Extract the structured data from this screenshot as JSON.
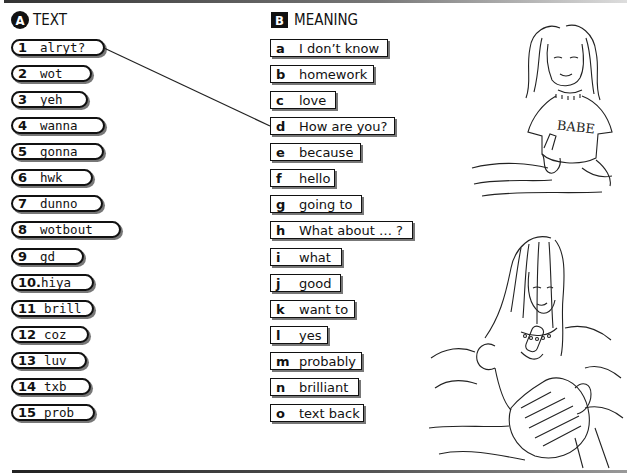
{
  "section_a": {
    "badge": "A",
    "title": "TEXT",
    "items": [
      {
        "num": "1",
        "text": "alryt?"
      },
      {
        "num": "2",
        "text": "wot"
      },
      {
        "num": "3",
        "text": "yeh"
      },
      {
        "num": "4",
        "text": "wanna"
      },
      {
        "num": "5",
        "text": "gonna"
      },
      {
        "num": "6",
        "text": "hwk"
      },
      {
        "num": "7",
        "text": "dunno"
      },
      {
        "num": "8",
        "text": "wotbout"
      },
      {
        "num": "9",
        "text": "gd"
      },
      {
        "num": "10.",
        "text": "hiya"
      },
      {
        "num": "11",
        "text": "brill"
      },
      {
        "num": "12",
        "text": "coz"
      },
      {
        "num": "13",
        "text": "luv"
      },
      {
        "num": "14",
        "text": "txb"
      },
      {
        "num": "15",
        "text": "prob"
      }
    ]
  },
  "section_b": {
    "badge": "B",
    "title": "MEANING",
    "items": [
      {
        "letter": "a",
        "text": "I don’t know"
      },
      {
        "letter": "b",
        "text": "homework"
      },
      {
        "letter": "c",
        "text": "love"
      },
      {
        "letter": "d",
        "text": "How are you?"
      },
      {
        "letter": "e",
        "text": "because"
      },
      {
        "letter": "f",
        "text": "hello"
      },
      {
        "letter": "g",
        "text": "going to"
      },
      {
        "letter": "h",
        "text": "What about … ?"
      },
      {
        "letter": "i",
        "text": "what"
      },
      {
        "letter": "j",
        "text": "good"
      },
      {
        "letter": "k",
        "text": "want to"
      },
      {
        "letter": "l",
        "text": "yes"
      },
      {
        "letter": "m",
        "text": "probably"
      },
      {
        "letter": "n",
        "text": "brilliant"
      },
      {
        "letter": "o",
        "text": "text back"
      }
    ]
  },
  "example_match": {
    "from": "1",
    "to": "d"
  },
  "illustration": {
    "shirt_text": "BABE"
  }
}
